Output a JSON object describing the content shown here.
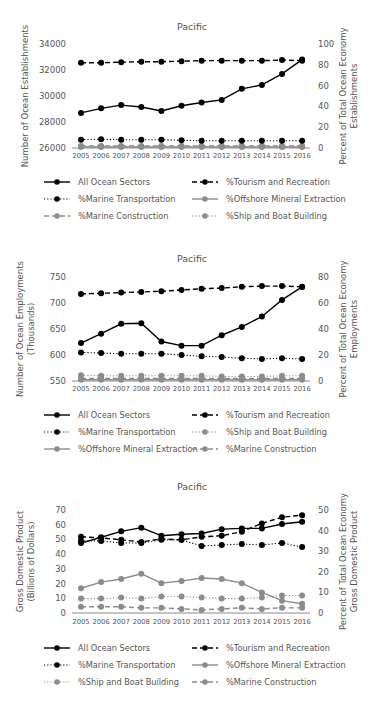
{
  "chart_data": [
    {
      "type": "line",
      "title": "Pacific",
      "xlabel": "",
      "ylabel": "Number of Ocean Establishments",
      "ylabel2": "Percent of Total Ocean Economy Establishments",
      "ylabel_lines": [
        "Number of Ocean Establishments"
      ],
      "ylabel2_lines": [
        "Percent of Total Ocean Economy",
        "Establishments"
      ],
      "x": [
        2005,
        2006,
        2007,
        2008,
        2009,
        2010,
        2011,
        2012,
        2013,
        2014,
        2015,
        2016
      ],
      "ylim": [
        26000,
        34000
      ],
      "yticks": [
        26000,
        28000,
        30000,
        32000,
        34000
      ],
      "y2lim": [
        0,
        100
      ],
      "y2ticks": [
        0,
        20,
        40,
        60,
        80,
        100
      ],
      "legend_position": "bottom",
      "grid": false,
      "series": [
        {
          "name": "All Ocean Sectors",
          "axis": "left",
          "style": "solid",
          "color": "#000000",
          "values": [
            28700,
            29050,
            29300,
            29150,
            28850,
            29250,
            29500,
            29700,
            30550,
            30850,
            31700,
            32800
          ]
        },
        {
          "name": "%Tourism and Recreation",
          "axis": "right",
          "style": "dashed",
          "color": "#000000",
          "values": [
            82,
            82,
            82.5,
            83,
            83,
            83.5,
            84,
            84,
            84,
            84,
            84.5,
            84
          ]
        },
        {
          "name": "%Marine Transportation",
          "axis": "right",
          "style": "dotted",
          "color": "#000000",
          "values": [
            8,
            8.5,
            8,
            8,
            8,
            7.5,
            7,
            7,
            7,
            7,
            7,
            7
          ]
        },
        {
          "name": "%Offshore Mineral Extraction",
          "axis": "right",
          "style": "solid",
          "color": "#8c8c8c",
          "values": [
            1,
            1,
            1,
            1,
            1,
            1,
            1,
            1,
            1,
            1,
            1,
            1
          ]
        },
        {
          "name": "%Marine Construction",
          "axis": "right",
          "style": "dashed",
          "color": "#8c8c8c",
          "values": [
            2,
            2,
            2,
            2,
            2,
            2,
            2,
            2,
            2,
            2,
            2,
            2
          ]
        },
        {
          "name": "%Ship and Boat Building",
          "axis": "right",
          "style": "dotted",
          "color": "#8c8c8c",
          "values": [
            1.5,
            1.5,
            1.5,
            1.5,
            1.5,
            1.5,
            1.5,
            1.5,
            1.5,
            1.5,
            1.5,
            1.5
          ]
        }
      ],
      "legend_order": [
        0,
        1,
        2,
        3,
        4,
        5
      ]
    },
    {
      "type": "line",
      "title": "Pacific",
      "xlabel": "",
      "ylabel": "Number of Ocean Employments (Thousands)",
      "ylabel2": "Percent of Total Ocean Economy Employments",
      "ylabel_lines": [
        "Number of Ocean Employments",
        "(Thousands)"
      ],
      "ylabel2_lines": [
        "Percent of Total Ocean Economy",
        "Employments"
      ],
      "x": [
        2005,
        2006,
        2007,
        2008,
        2009,
        2010,
        2011,
        2012,
        2013,
        2014,
        2015,
        2016
      ],
      "ylim": [
        550,
        750
      ],
      "yticks": [
        550,
        600,
        650,
        700,
        750
      ],
      "y2lim": [
        0,
        80
      ],
      "y2ticks": [
        0,
        20,
        40,
        60,
        80
      ],
      "legend_position": "bottom",
      "grid": false,
      "series": [
        {
          "name": "All Ocean Sectors",
          "axis": "left",
          "style": "solid",
          "color": "#000000",
          "values": [
            623,
            641,
            660,
            661,
            626,
            618,
            618,
            638,
            654,
            674,
            706,
            731
          ]
        },
        {
          "name": "%Tourism and Recreation",
          "axis": "right",
          "style": "dashed",
          "color": "#000000",
          "values": [
            67,
            67.5,
            68,
            68.5,
            69,
            70,
            71,
            71.5,
            72.5,
            73,
            73,
            72.5
          ]
        },
        {
          "name": "%Marine Transportation",
          "axis": "right",
          "style": "dotted",
          "color": "#000000",
          "values": [
            22,
            21.5,
            21,
            21,
            21,
            20,
            19,
            18.5,
            17.5,
            17,
            17.5,
            17
          ]
        },
        {
          "name": "%Ship and Boat Building",
          "axis": "right",
          "style": "dotted",
          "color": "#8c8c8c",
          "values": [
            4.5,
            4,
            4,
            4,
            4,
            4,
            4,
            3.5,
            3.5,
            3.5,
            4,
            4
          ]
        },
        {
          "name": "%Offshore Mineral Extraction",
          "axis": "right",
          "style": "solid",
          "color": "#8c8c8c",
          "values": [
            1,
            1,
            1,
            1,
            1,
            1,
            1,
            1,
            1,
            1,
            1,
            1
          ]
        },
        {
          "name": "%Marine Construction",
          "axis": "right",
          "style": "dashed",
          "color": "#8c8c8c",
          "values": [
            2,
            2,
            2,
            2,
            2,
            2,
            2,
            2,
            2,
            2,
            2,
            2
          ]
        }
      ],
      "legend_order": [
        0,
        1,
        2,
        3,
        4,
        5
      ]
    },
    {
      "type": "line",
      "title": "Pacific",
      "xlabel": "",
      "ylabel": "Gross Domestic Product (Billions of Dollars)",
      "ylabel2": "Percent of Total Ocean Economy Gross Domestic Product",
      "ylabel_lines": [
        "Gross Domestic Product",
        "(Billions of Dollars)"
      ],
      "ylabel2_lines": [
        "Percent of Total Ocean Economy",
        "Gross Domestic Product"
      ],
      "x": [
        2005,
        2006,
        2007,
        2008,
        2009,
        2010,
        2011,
        2012,
        2013,
        2014,
        2015,
        2016
      ],
      "ylim": [
        0,
        70
      ],
      "yticks": [
        0,
        10,
        20,
        30,
        40,
        50,
        60,
        70
      ],
      "y2lim": [
        0,
        50
      ],
      "y2ticks": [
        0,
        10,
        20,
        30,
        40,
        50
      ],
      "legend_position": "bottom",
      "grid": false,
      "series": [
        {
          "name": "All Ocean Sectors",
          "axis": "left",
          "style": "solid",
          "color": "#000000",
          "values": [
            47.5,
            51.5,
            55.5,
            58,
            52.5,
            53.5,
            54,
            57,
            57.5,
            57.5,
            60.5,
            62
          ]
        },
        {
          "name": "%Tourism and Recreation",
          "axis": "right",
          "style": "dashed",
          "color": "#000000",
          "values": [
            37,
            36.5,
            35.5,
            34.5,
            36,
            35.5,
            37,
            37.5,
            39.5,
            43.5,
            46.5,
            47.5
          ]
        },
        {
          "name": "%Marine Transportation",
          "axis": "right",
          "style": "dotted",
          "color": "#000000",
          "values": [
            35,
            35,
            34,
            34,
            35.5,
            35.5,
            32.5,
            33,
            33.5,
            33,
            34,
            32
          ]
        },
        {
          "name": "%Offshore Mineral Extraction",
          "axis": "right",
          "style": "solid",
          "color": "#8c8c8c",
          "values": [
            12,
            15,
            16.5,
            19,
            14.5,
            15.5,
            17,
            16.5,
            14.5,
            10,
            6,
            4.5
          ]
        },
        {
          "name": "%Ship and Boat Building",
          "axis": "right",
          "style": "dotted",
          "color": "#8c8c8c",
          "values": [
            7,
            7,
            7.5,
            7,
            8,
            8,
            7.5,
            7,
            7,
            7.5,
            8.5,
            8.5
          ]
        },
        {
          "name": "%Marine Construction",
          "axis": "right",
          "style": "dashed",
          "color": "#8c8c8c",
          "values": [
            3,
            3,
            3,
            2.5,
            2.5,
            2,
            1.5,
            2,
            2.5,
            2,
            2.5,
            2.5
          ]
        }
      ],
      "legend_order": [
        0,
        1,
        2,
        3,
        4,
        5
      ]
    }
  ]
}
